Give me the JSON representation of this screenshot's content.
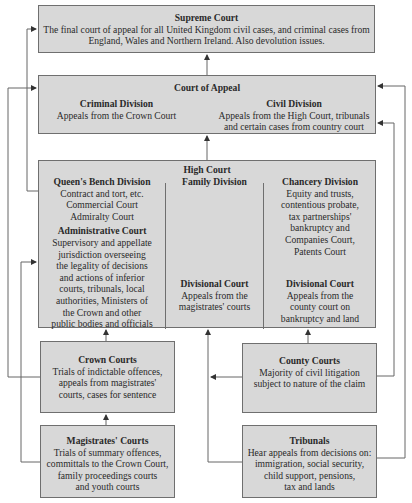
{
  "supreme_court": {
    "title": "Supreme Court",
    "text": "The final court of appeal for all United Kingdom civil cases, and criminal cases from\nEngland, Wales and Northern Ireland. Also devolution issues."
  },
  "court_of_appeal": {
    "title": "Court of Appeal",
    "criminal": {
      "title": "Criminal Division",
      "text": "Appeals from the Crown Court"
    },
    "civil": {
      "title": "Civil Division",
      "text": "Appeals from the High Court, tribunals\nand certain cases from country court"
    }
  },
  "high_court": {
    "title": "High Court",
    "queens_bench": {
      "title": "Queen's Bench Division",
      "text": "Contract and tort, etc.\nCommercial Court\nAdmiralty Court",
      "admin_title": "Administrative Court",
      "admin_text": "Supervisory and appellate\njurisdiction overseeing\nthe legality of decisions\nand actions of inferior\ncourts, tribunals, local\nauthorities, Ministers of\nthe Crown and other\npublic bodies and officials"
    },
    "family": {
      "title": "Family Division",
      "divisional_title": "Divisional Court",
      "divisional_text": "Appeals from the\nmagistrates' courts"
    },
    "chancery": {
      "title": "Chancery Division",
      "text": "Equity and trusts,\ncontentious probate,\ntax partnerships'\nbankruptcy and\nCompanies Court,\nPatents Court",
      "divisional_title": "Divisional Court",
      "divisional_text": "Appeals from the\ncounty court on\nbankruptcy and land"
    }
  },
  "crown_courts": {
    "title": "Crown Courts",
    "text": "Trials of indictable offences,\nappeals from magistrates'\ncourts, cases for sentence"
  },
  "county_courts": {
    "title": "County Courts",
    "text": "Majority of civil litigation\nsubject to nature of the claim"
  },
  "magistrates_courts": {
    "title": "Magistrates' Courts",
    "text": "Trials of summary offences,\ncommittals to the Crown Court,\nfamily proceedings courts\nand youth courts"
  },
  "tribunals": {
    "title": "Tribunals",
    "text": "Hear appeals from decisions on:\nimmigration, social security,\nchild support, pensions,\ntax and lands"
  },
  "colors": {
    "box_fill": "#d8d8d8",
    "border": "#6f6f6f",
    "line": "#555555",
    "text": "#2a2a2a"
  }
}
